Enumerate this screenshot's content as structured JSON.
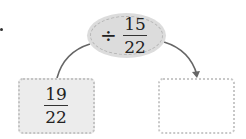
{
  "diagram": {
    "operation": {
      "operator": "÷",
      "numerator": "15",
      "denominator": "22"
    },
    "input": {
      "numerator": "19",
      "denominator": "22"
    },
    "output": {
      "value": ""
    },
    "colors": {
      "ellipse_fill": "#dcdcdc",
      "input_box_fill": "#ececec",
      "output_box_fill": "#ffffff",
      "arrow": "#666666"
    }
  }
}
